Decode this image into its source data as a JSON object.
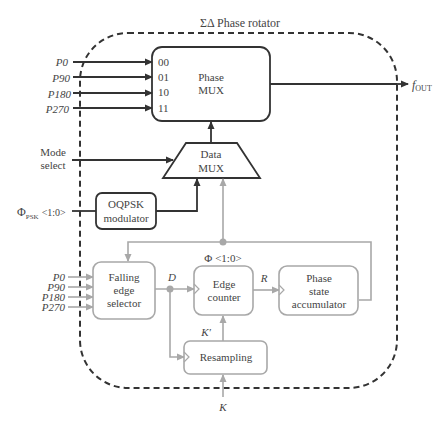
{
  "title": "ΣΔ Phase rotator",
  "colors": {
    "dark_line": "#333333",
    "gray_line": "#a8a8a8",
    "text": "#444444",
    "background": "#ffffff"
  },
  "inputs_top": [
    {
      "label": "P0",
      "port": "00"
    },
    {
      "label": "P90",
      "port": "01"
    },
    {
      "label": "P180",
      "port": "10"
    },
    {
      "label": "P270",
      "port": "11"
    }
  ],
  "inputs_bottom": [
    "P0",
    "P90",
    "P180",
    "P270"
  ],
  "blocks": {
    "phase_mux": {
      "line1": "Phase",
      "line2": "MUX"
    },
    "data_mux": {
      "line1": "Data",
      "line2": "MUX"
    },
    "oqpsk": {
      "line1": "OQPSK",
      "line2": "modulator"
    },
    "falling_edge": {
      "line1": "Falling",
      "line2": "edge",
      "line3": "selector"
    },
    "edge_counter": {
      "line1": "Edge",
      "line2": "counter"
    },
    "phase_state": {
      "line1": "Phase",
      "line2": "state",
      "line3": "accumulator"
    },
    "resampling": {
      "line1": "Resampling"
    }
  },
  "signals": {
    "output": "f",
    "output_sub": "OUT",
    "mode_select_line1": "Mode",
    "mode_select_line2": "select",
    "phi_psk": "Φ",
    "phi_psk_sub": "PSK",
    "phi_psk_bits": "<1:0>",
    "phi_bus": "Φ <1:0>",
    "d": "D",
    "r": "R",
    "k_prime": "K′",
    "k": "K"
  }
}
